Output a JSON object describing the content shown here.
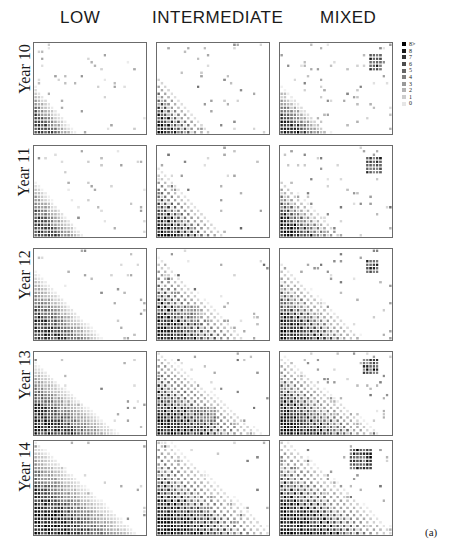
{
  "figure": {
    "subfigure_label": "(a)",
    "column_headers": [
      "LOW",
      "INTERMEDIATE",
      "MIXED"
    ],
    "row_labels": [
      "Year 10",
      "Year 11",
      "Year 12",
      "Year 13",
      "Year 14"
    ]
  },
  "legend": {
    "entries": [
      {
        "label": "8>",
        "color": "#000000"
      },
      {
        "label": "8",
        "color": "#1a1a1a"
      },
      {
        "label": "7",
        "color": "#333333"
      },
      {
        "label": "6",
        "color": "#4d4d4d"
      },
      {
        "label": "5",
        "color": "#666666"
      },
      {
        "label": "4",
        "color": "#808080"
      },
      {
        "label": "3",
        "color": "#999999"
      },
      {
        "label": "2",
        "color": "#b3b3b3"
      },
      {
        "label": "1",
        "color": "#cccccc"
      },
      {
        "label": "0",
        "color": "#e6e6e6"
      }
    ]
  },
  "chart_data": {
    "type": "heatmap",
    "title": "",
    "xlabel": "",
    "ylabel": "",
    "grid": false,
    "legend_position": "right",
    "colormap": "grayscale-inverted",
    "value_range": [
      0,
      9
    ],
    "value_labels": [
      "0",
      "1",
      "2",
      "3",
      "4",
      "5",
      "6",
      "7",
      "8",
      "8>"
    ],
    "panel_rows": [
      "Year 10",
      "Year 11",
      "Year 12",
      "Year 13",
      "Year 14"
    ],
    "panel_cols": [
      "LOW",
      "INTERMEDIATE",
      "MIXED"
    ],
    "cells_x": 34,
    "cells_y": 26,
    "panels": [
      {
        "row": "Year 10",
        "col": "LOW",
        "density": 0.3,
        "front_x": 0.36,
        "front_y": 0.52,
        "stripe": 0.0,
        "cluster": null,
        "noise": 0.12,
        "intensity": 0.72
      },
      {
        "row": "Year 10",
        "col": "INTERMEDIATE",
        "density": 0.4,
        "front_x": 0.46,
        "front_y": 0.62,
        "stripe": 0.85,
        "cluster": null,
        "noise": 0.1,
        "intensity": 0.92
      },
      {
        "row": "Year 10",
        "col": "MIXED",
        "density": 0.38,
        "front_x": 0.44,
        "front_y": 0.5,
        "stripe": 0.25,
        "cluster": {
          "x": 0.8,
          "y": 0.12,
          "w": 0.13,
          "h": 0.16,
          "intensity": 0.95
        },
        "noise": 0.18,
        "intensity": 0.88
      },
      {
        "row": "Year 11",
        "col": "LOW",
        "density": 0.38,
        "front_x": 0.42,
        "front_y": 0.6,
        "stripe": 0.0,
        "cluster": null,
        "noise": 0.12,
        "intensity": 0.76
      },
      {
        "row": "Year 11",
        "col": "INTERMEDIATE",
        "density": 0.5,
        "front_x": 0.58,
        "front_y": 0.74,
        "stripe": 0.88,
        "cluster": null,
        "noise": 0.1,
        "intensity": 0.94
      },
      {
        "row": "Year 11",
        "col": "MIXED",
        "density": 0.47,
        "front_x": 0.54,
        "front_y": 0.62,
        "stripe": 0.55,
        "cluster": {
          "x": 0.78,
          "y": 0.12,
          "w": 0.15,
          "h": 0.18,
          "intensity": 0.95
        },
        "noise": 0.18,
        "intensity": 0.9
      },
      {
        "row": "Year 12",
        "col": "LOW",
        "density": 0.5,
        "front_x": 0.58,
        "front_y": 0.72,
        "stripe": 0.0,
        "cluster": null,
        "noise": 0.1,
        "intensity": 0.8
      },
      {
        "row": "Year 12",
        "col": "INTERMEDIATE",
        "density": 0.64,
        "front_x": 0.74,
        "front_y": 0.86,
        "stripe": 0.9,
        "cluster": {
          "x": 0.1,
          "y": 0.62,
          "w": 0.28,
          "h": 0.22,
          "intensity": 0.55
        },
        "noise": 0.1,
        "intensity": 0.95
      },
      {
        "row": "Year 12",
        "col": "MIXED",
        "density": 0.6,
        "front_x": 0.7,
        "front_y": 0.8,
        "stripe": 0.7,
        "cluster": {
          "x": 0.76,
          "y": 0.1,
          "w": 0.14,
          "h": 0.16,
          "intensity": 0.95
        },
        "noise": 0.16,
        "intensity": 0.93
      },
      {
        "row": "Year 13",
        "col": "LOW",
        "density": 0.6,
        "front_x": 0.7,
        "front_y": 0.82,
        "stripe": 0.0,
        "cluster": null,
        "noise": 0.1,
        "intensity": 0.84
      },
      {
        "row": "Year 13",
        "col": "INTERMEDIATE",
        "density": 0.76,
        "front_x": 0.86,
        "front_y": 0.94,
        "stripe": 0.9,
        "cluster": {
          "x": 0.18,
          "y": 0.66,
          "w": 0.34,
          "h": 0.26,
          "intensity": 0.6
        },
        "noise": 0.1,
        "intensity": 0.96
      },
      {
        "row": "Year 13",
        "col": "MIXED",
        "density": 0.72,
        "front_x": 0.82,
        "front_y": 0.9,
        "stripe": 0.75,
        "cluster": {
          "x": 0.74,
          "y": 0.08,
          "w": 0.16,
          "h": 0.18,
          "intensity": 0.95
        },
        "noise": 0.16,
        "intensity": 0.95
      },
      {
        "row": "Year 14",
        "col": "LOW",
        "density": 0.72,
        "front_x": 0.84,
        "front_y": 0.92,
        "stripe": 0.0,
        "cluster": {
          "x": 0.06,
          "y": 0.72,
          "w": 0.22,
          "h": 0.2,
          "intensity": 0.5
        },
        "noise": 0.1,
        "intensity": 0.88
      },
      {
        "row": "Year 14",
        "col": "INTERMEDIATE",
        "density": 0.88,
        "front_x": 0.94,
        "front_y": 0.98,
        "stripe": 0.88,
        "cluster": {
          "x": 0.06,
          "y": 0.7,
          "w": 0.4,
          "h": 0.28,
          "intensity": 0.68
        },
        "noise": 0.08,
        "intensity": 0.97
      },
      {
        "row": "Year 14",
        "col": "MIXED",
        "density": 0.86,
        "front_x": 0.94,
        "front_y": 0.96,
        "stripe": 0.8,
        "cluster": {
          "x": 0.62,
          "y": 0.06,
          "w": 0.22,
          "h": 0.22,
          "intensity": 0.97
        },
        "noise": 0.14,
        "intensity": 0.97
      }
    ]
  },
  "layout": {
    "panel_left": [
      33,
      156,
      279
    ],
    "panel_top": [
      42,
      145,
      248,
      351,
      440
    ],
    "panel_width": 114,
    "panel_height": [
      93,
      93,
      93,
      85,
      96
    ],
    "header_left": [
      60,
      152,
      320
    ],
    "row_label_top": [
      60,
      163,
      266,
      366,
      458
    ]
  }
}
